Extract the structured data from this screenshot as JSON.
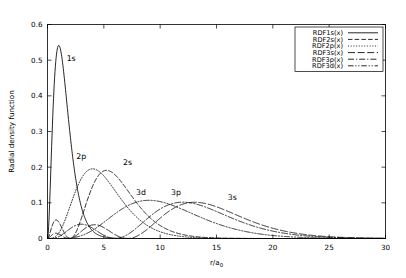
{
  "chart_data": {
    "type": "line",
    "title": "",
    "xlabel": "r/a0",
    "xlabel_base": "r/a",
    "xlabel_sub": "0",
    "ylabel": "Radial density function",
    "xlim": [
      0,
      30
    ],
    "ylim": [
      0,
      0.6
    ],
    "xticks": [
      0,
      5,
      10,
      15,
      20,
      25,
      30
    ],
    "xtick_labels": [
      "0",
      "5",
      "10",
      "15",
      "20",
      "25",
      "30"
    ],
    "yticks": [
      0,
      0.1,
      0.2,
      0.3,
      0.4,
      0.5,
      0.6
    ],
    "ytick_labels": [
      "0",
      "0.1",
      "0.2",
      "0.3",
      "0.4",
      "0.5",
      "0.6"
    ],
    "grid": false,
    "legend_position": "top-right",
    "series": [
      {
        "name": "RDF1s(x)",
        "orbital": "1s",
        "dash": "none",
        "peak_x": 1.0,
        "peak_y": 0.541,
        "annotation": "1s",
        "annotation_x": 2.1,
        "annotation_y": 0.497
      },
      {
        "name": "RDF2s(x)",
        "orbital": "2s",
        "dash": "dashed",
        "peak_x": 5.24,
        "peak_y": 0.191,
        "annotation": "2s",
        "annotation_x": 7.1,
        "annotation_y": 0.205
      },
      {
        "name": "RDF2p(x)",
        "orbital": "2p",
        "dash": "dotted",
        "peak_x": 4.0,
        "peak_y": 0.201,
        "annotation": "2p",
        "annotation_x": 3.0,
        "annotation_y": 0.222
      },
      {
        "name": "RDF3s(x)",
        "orbital": "3s",
        "dash": "longdash",
        "peak_x": 13.07,
        "peak_y": 0.102,
        "annotation": "3s",
        "annotation_x": 16.4,
        "annotation_y": 0.108
      },
      {
        "name": "RDF3p(x)",
        "orbital": "3p",
        "dash": "dashdot",
        "peak_x": 12.0,
        "peak_y": 0.107,
        "annotation": "3p",
        "annotation_x": 11.4,
        "annotation_y": 0.123
      },
      {
        "name": "RDF3d(x)",
        "orbital": "3d",
        "dash": "dashdotdot",
        "peak_x": 9.0,
        "peak_y": 0.101,
        "annotation": "3d",
        "annotation_x": 8.3,
        "annotation_y": 0.123
      }
    ],
    "annotations": [
      "1s",
      "2p",
      "2s",
      "3d",
      "3p",
      "3s"
    ],
    "colors": {
      "line": "#000000",
      "background": "#ffffff",
      "frame": "#000000"
    }
  }
}
